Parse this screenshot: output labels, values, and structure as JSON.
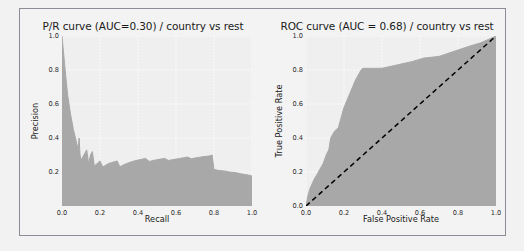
{
  "figure": {
    "background": "#f3f3f3",
    "plot_background": "#efefef",
    "fill_color": "#a8a8a8",
    "grid_color": "#ffffff",
    "diagonal_color": "#000000"
  },
  "chart_data": [
    {
      "type": "area",
      "title": "P/R curve (AUC=0.30) / country vs rest",
      "xlabel": "Recall",
      "ylabel": "Precision",
      "xlim": [
        0.0,
        1.0
      ],
      "ylim": [
        0.0,
        1.0
      ],
      "xticks": [
        "0.0",
        "0.2",
        "0.4",
        "0.6",
        "0.8",
        "1.0"
      ],
      "xtick_values": [
        0.0,
        0.2,
        0.4,
        0.6,
        0.8,
        1.0
      ],
      "yticks": [
        "0.2",
        "0.4",
        "0.6",
        "0.8",
        "1.0"
      ],
      "ytick_values": [
        0.2,
        0.4,
        0.6,
        0.8,
        1.0
      ],
      "grid": true,
      "legend": "none",
      "auc": 0.3,
      "x": [
        0.0,
        0.01,
        0.02,
        0.03,
        0.045,
        0.06,
        0.075,
        0.085,
        0.09,
        0.095,
        0.1,
        0.11,
        0.12,
        0.13,
        0.14,
        0.15,
        0.16,
        0.17,
        0.18,
        0.19,
        0.2,
        0.215,
        0.23,
        0.245,
        0.26,
        0.275,
        0.29,
        0.305,
        0.32,
        0.34,
        0.36,
        0.38,
        0.4,
        0.42,
        0.44,
        0.46,
        0.48,
        0.5,
        0.52,
        0.54,
        0.56,
        0.58,
        0.6,
        0.62,
        0.64,
        0.66,
        0.68,
        0.7,
        0.72,
        0.74,
        0.76,
        0.78,
        0.79,
        0.8,
        0.82,
        0.84,
        0.86,
        0.88,
        0.9,
        0.92,
        0.94,
        0.96,
        0.98,
        1.0
      ],
      "y": [
        1.0,
        0.88,
        0.76,
        0.65,
        0.54,
        0.45,
        0.38,
        0.33,
        0.4,
        0.3,
        0.27,
        0.29,
        0.31,
        0.33,
        0.25,
        0.3,
        0.32,
        0.235,
        0.245,
        0.255,
        0.265,
        0.23,
        0.24,
        0.25,
        0.255,
        0.26,
        0.265,
        0.23,
        0.24,
        0.25,
        0.258,
        0.265,
        0.27,
        0.275,
        0.28,
        0.262,
        0.268,
        0.272,
        0.276,
        0.28,
        0.268,
        0.272,
        0.276,
        0.28,
        0.284,
        0.288,
        0.278,
        0.282,
        0.286,
        0.29,
        0.292,
        0.295,
        0.3,
        0.215,
        0.21,
        0.208,
        0.205,
        0.2,
        0.198,
        0.195,
        0.19,
        0.186,
        0.182,
        0.176
      ]
    },
    {
      "type": "area",
      "title": "ROC curve (AUC = 0.68) / country vs rest",
      "xlabel": "False Positive Rate",
      "ylabel": "True Positive Rate",
      "xlim": [
        0.0,
        1.0
      ],
      "ylim": [
        0.0,
        1.0
      ],
      "xticks": [
        "0.0",
        "0.2",
        "0.4",
        "0.6",
        "0.8",
        "1.0"
      ],
      "xtick_values": [
        0.0,
        0.2,
        0.4,
        0.6,
        0.8,
        1.0
      ],
      "yticks": [
        "0.0",
        "0.2",
        "0.4",
        "0.6",
        "0.8",
        "1.0"
      ],
      "ytick_values": [
        0.0,
        0.2,
        0.4,
        0.6,
        0.8,
        1.0
      ],
      "grid": true,
      "legend": "none",
      "auc": 0.68,
      "reference_line": {
        "from": [
          0.0,
          0.0
        ],
        "to": [
          1.0,
          1.0
        ],
        "style": "dashed"
      },
      "x": [
        0.0,
        0.005,
        0.01,
        0.015,
        0.02,
        0.028,
        0.036,
        0.044,
        0.052,
        0.06,
        0.07,
        0.08,
        0.09,
        0.1,
        0.11,
        0.12,
        0.13,
        0.14,
        0.15,
        0.16,
        0.17,
        0.18,
        0.19,
        0.2,
        0.215,
        0.23,
        0.245,
        0.26,
        0.275,
        0.29,
        0.3,
        0.32,
        0.4,
        0.48,
        0.56,
        0.62,
        0.7,
        0.78,
        0.86,
        0.92,
        0.96,
        1.0
      ],
      "y": [
        0.0,
        0.03,
        0.06,
        0.08,
        0.1,
        0.12,
        0.14,
        0.16,
        0.175,
        0.19,
        0.21,
        0.23,
        0.25,
        0.28,
        0.31,
        0.33,
        0.4,
        0.42,
        0.44,
        0.45,
        0.46,
        0.5,
        0.54,
        0.58,
        0.62,
        0.66,
        0.7,
        0.74,
        0.77,
        0.8,
        0.81,
        0.81,
        0.81,
        0.83,
        0.85,
        0.87,
        0.88,
        0.91,
        0.94,
        0.96,
        0.98,
        1.0
      ]
    }
  ]
}
